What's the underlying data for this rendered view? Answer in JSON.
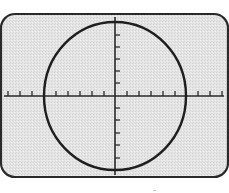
{
  "figure": {
    "colors": {
      "screen_fill": "#e6e6e6",
      "frame_stroke": "#2a2a2a",
      "trace": "#1e1e1e",
      "graticule": "#2a2a2a",
      "background": "#ffffff"
    },
    "screen": {
      "x": 1,
      "y": 14,
      "width": 227,
      "height": 163,
      "corner_radius": 14
    },
    "axes": {
      "center": {
        "x": 115,
        "y": 96
      },
      "horizontal": {
        "x1": 4,
        "x2": 224
      },
      "vertical": {
        "y1": 17,
        "y2": 175
      },
      "tick_length": 5,
      "horizontal_ticks_x": [
        8,
        20,
        32,
        56,
        68,
        80,
        92,
        104,
        127,
        139,
        151,
        163,
        175,
        198,
        210,
        222
      ],
      "vertical_ticks_y": [
        35,
        47,
        59,
        71,
        83,
        108,
        120,
        133,
        145,
        158
      ]
    },
    "trace": {
      "shape": "circle",
      "cx": 115,
      "cy": 96,
      "rx": 71,
      "ry": 74
    }
  }
}
